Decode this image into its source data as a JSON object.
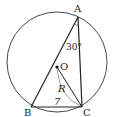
{
  "diagram": {
    "points": {
      "A": {
        "label": "A"
      },
      "B": {
        "label": "B"
      },
      "C": {
        "label": "C"
      },
      "O": {
        "label": "O"
      }
    },
    "angle_A": "30°",
    "side_BC": "7",
    "radius_label": "R",
    "colors": {
      "stroke": "#222222",
      "background": "#ffffff"
    }
  }
}
